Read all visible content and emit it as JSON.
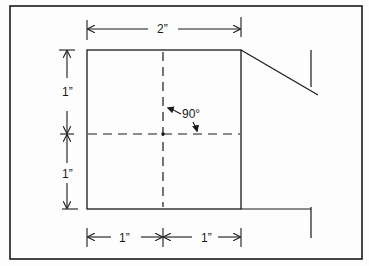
{
  "diagram": {
    "type": "technical-drawing",
    "colors": {
      "line": "#1a1a1a",
      "background": "#fdfdfd"
    },
    "labels": {
      "top_width": "2”",
      "left_upper_height": "1”",
      "left_lower_height": "1”",
      "bottom_left_width": "1”",
      "bottom_right_width": "1”",
      "angle": "90°"
    },
    "shapes": {
      "square": {
        "x": 87,
        "y": 50,
        "width": 154,
        "height": 159
      },
      "center_point": {
        "x": 163,
        "y": 134
      },
      "vertical_axis": "dashed",
      "horizontal_axis": "dashed"
    }
  }
}
